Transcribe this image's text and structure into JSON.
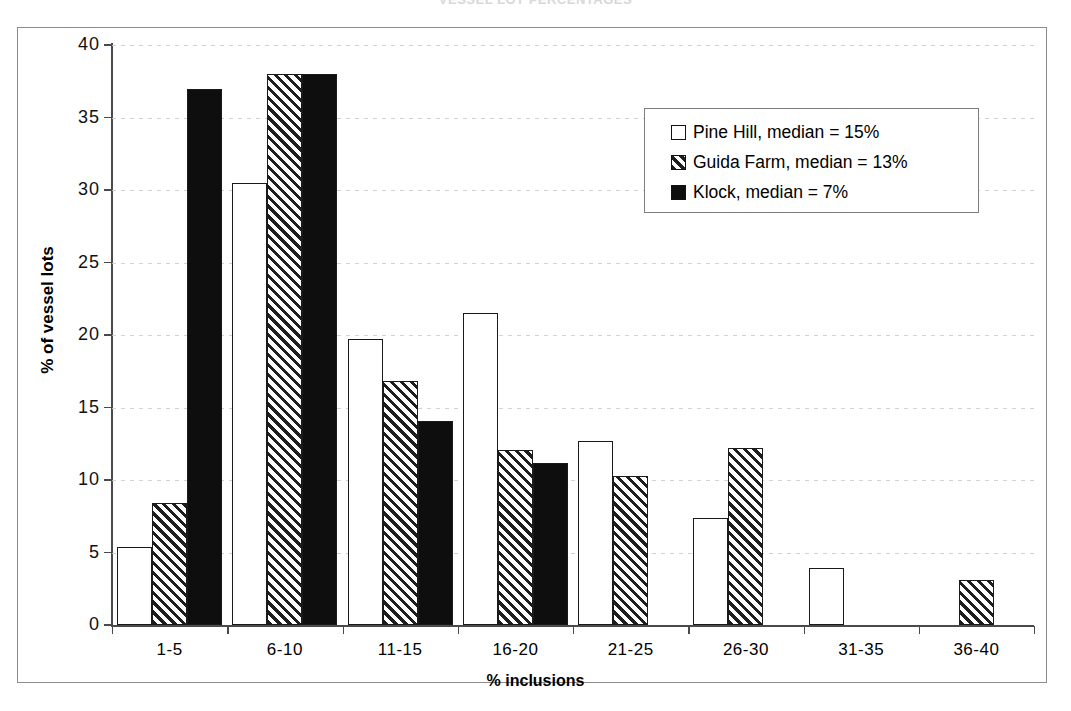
{
  "figure": {
    "title": "VESSEL LOT PERCENTAGES"
  },
  "chart_data": {
    "type": "bar",
    "title": "",
    "xlabel": "% inclusions",
    "ylabel": "% of vessel lots",
    "ylim": [
      0,
      40
    ],
    "ytick_step": 5,
    "yticks": [
      "40",
      "35",
      "30",
      "25",
      "20",
      "15",
      "10",
      "5",
      "0"
    ],
    "grid": true,
    "legend_position": "upper-right",
    "categories": [
      "1-5",
      "6-10",
      "11-15",
      "16-20",
      "21-25",
      "26-30",
      "31-35",
      "36-40"
    ],
    "series": [
      {
        "name": "Pine Hill, median = 15%",
        "short_name": "Pine Hill",
        "median": "15%",
        "pattern": "dotted-stipple",
        "values": [
          5.4,
          30.5,
          19.7,
          21.5,
          12.7,
          7.4,
          3.9,
          0
        ]
      },
      {
        "name": "Guida Farm, median = 13%",
        "short_name": "Guida Farm",
        "median": "13%",
        "pattern": "diagonal-hatch",
        "values": [
          8.4,
          38.0,
          16.8,
          12.1,
          10.3,
          12.2,
          0,
          3.1
        ]
      },
      {
        "name": "Klock, median = 7%",
        "short_name": "Klock",
        "median": "7%",
        "pattern": "solid-black",
        "values": [
          37.0,
          38.0,
          14.1,
          11.2,
          0,
          0,
          0,
          0
        ]
      }
    ]
  },
  "colors": {
    "ink": "#111111",
    "frame": "#8d8d8d",
    "axis": "#4a4a4a",
    "grid": "#c9c9c9",
    "solid_fill": "#0e0e0e"
  }
}
